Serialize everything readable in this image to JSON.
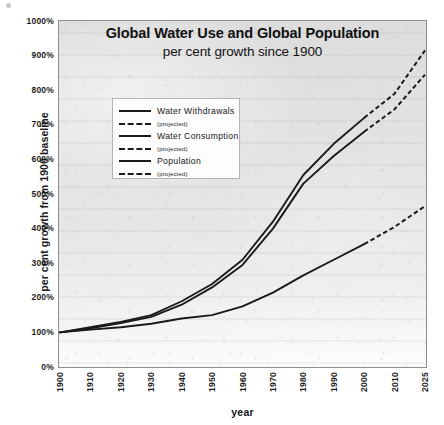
{
  "chart_data": {
    "type": "line",
    "title": "Global Water Use and Global Population",
    "subtitle": "per cent growth since 1900",
    "xlabel": "year",
    "ylabel": "per cent growth from 1900 baseline",
    "categories": [
      "1900",
      "1910",
      "1920",
      "1930",
      "1940",
      "1950",
      "1960",
      "1970",
      "1980",
      "1990",
      "2000",
      "2010",
      "2025"
    ],
    "x_tick_labels": [
      "1900",
      "1910",
      "1920",
      "1930",
      "1940",
      "1950",
      "1960",
      "1970",
      "1980",
      "1990",
      "2000",
      "2010",
      "2025"
    ],
    "y_tick_labels": [
      "0%",
      "100%",
      "200%",
      "300%",
      "400%",
      "500%",
      "600%",
      "700%",
      "800%",
      "900%",
      "1000%"
    ],
    "y_tick_values": [
      0,
      100,
      200,
      300,
      400,
      500,
      600,
      700,
      800,
      900,
      1000
    ],
    "ylim": [
      0,
      1000
    ],
    "grid": false,
    "legend_position": "upper-left-inside",
    "projection_starts_at": "2000",
    "series": [
      {
        "name": "Water Withdrawals",
        "projected_name": "(projected)",
        "color": "#1a1a1a",
        "values": [
          100,
          115,
          130,
          150,
          190,
          240,
          310,
          420,
          555,
          645,
          720,
          790,
          915
        ]
      },
      {
        "name": "Water Consumption",
        "projected_name": "(projected)",
        "color": "#1a1a1a",
        "values": [
          100,
          112,
          127,
          145,
          180,
          230,
          295,
          400,
          530,
          610,
          680,
          745,
          845
        ]
      },
      {
        "name": "Population",
        "projected_name": "(projected)",
        "color": "#1a1a1a",
        "values": [
          100,
          108,
          115,
          125,
          140,
          150,
          175,
          215,
          265,
          310,
          355,
          405,
          465
        ]
      }
    ]
  },
  "legend": {
    "entries": [
      {
        "label": "Water Withdrawals",
        "sublabel": "(projected)"
      },
      {
        "label": "Water Consumption",
        "sublabel": "(projected)"
      },
      {
        "label": "Population",
        "sublabel": "(projected)"
      }
    ]
  },
  "colors": {
    "line": "#1a1a1a",
    "plot_background": "#e3e3e2",
    "plot_border": "#8d8d8d",
    "legend_background": "#fdfdfd",
    "text": "#1a1a1a"
  }
}
